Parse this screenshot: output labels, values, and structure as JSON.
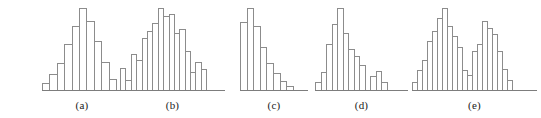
{
  "figure": {
    "bar_outline_color": "#8c8c8c",
    "axis_color": "#7d7d7d",
    "background_color": "#ffffff",
    "caption_color": "#1a1a1a"
  },
  "chart_data": [
    {
      "type": "bar",
      "title": "(a)",
      "shape": "symmetric bell-shaped",
      "xlabel": "",
      "ylabel": "",
      "ylim": [
        0,
        100
      ],
      "grid": false,
      "legend": "none",
      "categories": [
        "1",
        "2",
        "3",
        "4",
        "5",
        "6",
        "7",
        "8",
        "9",
        "10"
      ],
      "values": [
        9,
        20,
        33,
        56,
        78,
        100,
        84,
        60,
        34,
        13
      ]
    },
    {
      "type": "bar",
      "title": "(b)",
      "shape": "roughly symmetric, irregular",
      "xlabel": "",
      "ylabel": "",
      "ylim": [
        0,
        100
      ],
      "grid": false,
      "legend": "none",
      "categories": [
        "1",
        "2",
        "3",
        "4",
        "5",
        "6",
        "7",
        "8",
        "9",
        "10",
        "11",
        "12",
        "13",
        "14"
      ],
      "values": [
        27,
        12,
        44,
        37,
        63,
        72,
        82,
        100,
        90,
        93,
        70,
        74,
        48,
        22,
        34,
        26
      ]
    },
    {
      "type": "bar",
      "title": "(c)",
      "shape": "right-skewed",
      "xlabel": "",
      "ylabel": "",
      "ylim": [
        0,
        100
      ],
      "grid": false,
      "legend": "none",
      "categories": [
        "1",
        "2",
        "3",
        "4",
        "5",
        "6",
        "7",
        "8"
      ],
      "values": [
        83,
        100,
        78,
        52,
        33,
        21,
        11,
        5
      ]
    },
    {
      "type": "bar",
      "title": "(d)",
      "shape": "right-skewed with outlier cluster",
      "xlabel": "",
      "ylabel": "",
      "ylim": [
        0,
        100
      ],
      "grid": false,
      "legend": "none",
      "categories": [
        "1",
        "2",
        "3",
        "4",
        "5",
        "6",
        "7",
        "8",
        "9",
        "10",
        "11",
        "12",
        "13"
      ],
      "values": [
        10,
        22,
        56,
        81,
        100,
        69,
        50,
        41,
        30,
        0,
        17,
        23,
        10
      ]
    },
    {
      "type": "bar",
      "title": "(e)",
      "shape": "bimodal",
      "xlabel": "",
      "ylabel": "",
      "ylim": [
        0,
        100
      ],
      "grid": false,
      "legend": "none",
      "categories": [
        "1",
        "2",
        "3",
        "4",
        "5",
        "6",
        "7",
        "8",
        "9",
        "10",
        "11",
        "12",
        "13",
        "14",
        "15",
        "16",
        "17",
        "18",
        "19"
      ],
      "values": [
        10,
        24,
        37,
        60,
        72,
        88,
        100,
        78,
        66,
        52,
        25,
        18,
        48,
        56,
        84,
        76,
        68,
        47,
        26,
        12
      ]
    }
  ],
  "panels": [
    {
      "id": "panel-a",
      "caption": "(a)",
      "left": 42,
      "width": 80,
      "bar_width": 8.4
    },
    {
      "id": "panel-b",
      "caption": "(b)",
      "left": 120,
      "width": 105,
      "bar_width": 6.4
    },
    {
      "id": "panel-c",
      "caption": "(c)",
      "left": 240,
      "width": 68,
      "bar_width": 7.6
    },
    {
      "id": "panel-d",
      "caption": "(d)",
      "left": 315,
      "width": 93,
      "bar_width": 6.5
    },
    {
      "id": "panel-e",
      "caption": "(e)",
      "left": 412,
      "width": 125,
      "bar_width": 6.0
    }
  ]
}
